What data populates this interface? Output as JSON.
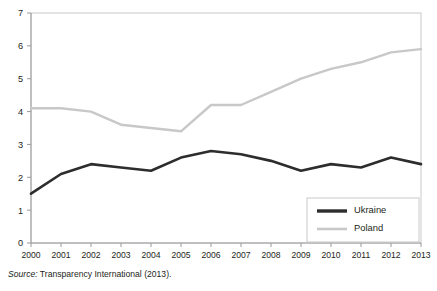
{
  "caption": {
    "source_word": "Source:",
    "source_text": " Transparency International (2013)."
  },
  "colors": {
    "ukraine": "#2d2d2d",
    "poland": "#c8c8c8",
    "frame": "#c9c9c9",
    "axis": "#9a9a9a",
    "text": "#231f20",
    "background": "#ffffff"
  },
  "chart_data": {
    "type": "line",
    "title": "",
    "xlabel": "",
    "ylabel": "",
    "categories": [
      "2000",
      "2001",
      "2002",
      "2003",
      "2004",
      "2005",
      "2006",
      "2007",
      "2008",
      "2009",
      "2010",
      "2011",
      "2012",
      "2013"
    ],
    "x": [
      2000,
      2001,
      2002,
      2003,
      2004,
      2005,
      2006,
      2007,
      2008,
      2009,
      2010,
      2011,
      2012,
      2013
    ],
    "series": [
      {
        "name": "Ukraine",
        "color": "#2d2d2d",
        "values": [
          1.5,
          2.1,
          2.4,
          2.3,
          2.2,
          2.6,
          2.8,
          2.7,
          2.5,
          2.2,
          2.4,
          2.3,
          2.6,
          2.4
        ]
      },
      {
        "name": "Poland",
        "color": "#c8c8c8",
        "values": [
          4.1,
          4.1,
          4.0,
          3.6,
          3.5,
          3.4,
          4.2,
          4.2,
          4.6,
          5.0,
          5.3,
          5.5,
          5.8,
          5.9
        ]
      }
    ],
    "yticks": [
      0,
      1,
      2,
      3,
      4,
      5,
      6,
      7
    ],
    "ytick_labels": [
      "0",
      "1",
      "2",
      "3",
      "4",
      "5",
      "6",
      "7"
    ],
    "ylim": [
      0,
      7
    ],
    "xlim": [
      2000,
      2013
    ],
    "grid": false,
    "legend_position": "bottom-right",
    "legend_entries": [
      "Ukraine",
      "Poland"
    ]
  }
}
